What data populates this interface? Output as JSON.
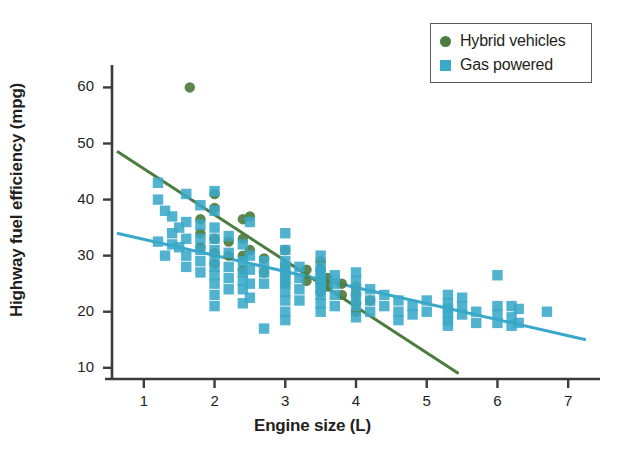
{
  "chart_data": {
    "type": "scatter",
    "title": "",
    "xlabel": "Engine size (L)",
    "ylabel": "Highway fuel efficiency (mpg)",
    "xlim": [
      0.55,
      7.45
    ],
    "ylim": [
      8.0,
      64.0
    ],
    "xticks": [
      1,
      2,
      3,
      4,
      5,
      6,
      7
    ],
    "yticks": [
      10,
      20,
      30,
      40,
      50,
      60
    ],
    "grid": false,
    "legend_position": "top-right",
    "legend": [
      {
        "name": "Hybrid vehicles",
        "marker": "circle",
        "color": "#4d7c3f"
      },
      {
        "name": "Gas powered",
        "marker": "square",
        "color": "#39a8c9"
      }
    ],
    "series": [
      {
        "name": "Hybrid vehicles",
        "marker": "circle",
        "color": "#4d7c3f",
        "points": [
          [
            1.65,
            60.0
          ],
          [
            1.8,
            36.5
          ],
          [
            1.8,
            34.0
          ],
          [
            1.8,
            31.5
          ],
          [
            2.0,
            41.0
          ],
          [
            2.0,
            38.5
          ],
          [
            2.0,
            33.0
          ],
          [
            2.0,
            30.5
          ],
          [
            2.0,
            28.5
          ],
          [
            2.2,
            32.5
          ],
          [
            2.2,
            30.0
          ],
          [
            2.4,
            36.5
          ],
          [
            2.4,
            33.0
          ],
          [
            2.4,
            30.0
          ],
          [
            2.4,
            27.5
          ],
          [
            2.5,
            37.0
          ],
          [
            2.5,
            31.0
          ],
          [
            2.7,
            29.5
          ],
          [
            2.7,
            27.0
          ],
          [
            3.0,
            31.0
          ],
          [
            3.0,
            28.0
          ],
          [
            3.0,
            26.5
          ],
          [
            3.0,
            25.0
          ],
          [
            3.3,
            27.5
          ],
          [
            3.3,
            25.5
          ],
          [
            3.5,
            29.0
          ],
          [
            3.5,
            27.5
          ],
          [
            3.5,
            26.0
          ],
          [
            3.5,
            25.0
          ],
          [
            3.5,
            23.5
          ],
          [
            3.6,
            26.0
          ],
          [
            3.6,
            24.5
          ],
          [
            3.8,
            25.0
          ],
          [
            3.8,
            23.0
          ],
          [
            4.0,
            24.5
          ],
          [
            4.0,
            23.0
          ],
          [
            4.0,
            21.5
          ],
          [
            4.0,
            20.0
          ],
          [
            4.2,
            22.0
          ]
        ]
      },
      {
        "name": "Gas powered",
        "marker": "square",
        "color": "#39a8c9",
        "points": [
          [
            1.2,
            43.0
          ],
          [
            1.2,
            40.0
          ],
          [
            1.2,
            32.5
          ],
          [
            1.3,
            38.0
          ],
          [
            1.3,
            30.0
          ],
          [
            1.4,
            37.0
          ],
          [
            1.4,
            34.0
          ],
          [
            1.4,
            32.0
          ],
          [
            1.5,
            35.0
          ],
          [
            1.5,
            31.5
          ],
          [
            1.6,
            41.0
          ],
          [
            1.6,
            36.0
          ],
          [
            1.6,
            33.0
          ],
          [
            1.6,
            30.0
          ],
          [
            1.6,
            28.0
          ],
          [
            1.8,
            39.0
          ],
          [
            1.8,
            35.5
          ],
          [
            1.8,
            33.0
          ],
          [
            1.8,
            31.0
          ],
          [
            1.8,
            29.0
          ],
          [
            1.8,
            27.0
          ],
          [
            2.0,
            41.5
          ],
          [
            2.0,
            38.0
          ],
          [
            2.0,
            35.0
          ],
          [
            2.0,
            33.0
          ],
          [
            2.0,
            31.0
          ],
          [
            2.0,
            29.5
          ],
          [
            2.0,
            28.0
          ],
          [
            2.0,
            26.5
          ],
          [
            2.0,
            25.0
          ],
          [
            2.0,
            23.0
          ],
          [
            2.0,
            21.0
          ],
          [
            2.2,
            33.5
          ],
          [
            2.2,
            30.5
          ],
          [
            2.2,
            28.0
          ],
          [
            2.2,
            26.0
          ],
          [
            2.2,
            24.0
          ],
          [
            2.4,
            32.0
          ],
          [
            2.4,
            29.0
          ],
          [
            2.4,
            27.0
          ],
          [
            2.4,
            25.5
          ],
          [
            2.4,
            24.0
          ],
          [
            2.4,
            21.5
          ],
          [
            2.5,
            36.0
          ],
          [
            2.5,
            30.0
          ],
          [
            2.5,
            27.5
          ],
          [
            2.5,
            25.0
          ],
          [
            2.5,
            22.5
          ],
          [
            2.7,
            29.0
          ],
          [
            2.7,
            27.0
          ],
          [
            2.7,
            25.0
          ],
          [
            2.7,
            17.0
          ],
          [
            3.0,
            34.0
          ],
          [
            3.0,
            31.0
          ],
          [
            3.0,
            29.0
          ],
          [
            3.0,
            28.0
          ],
          [
            3.0,
            27.0
          ],
          [
            3.0,
            26.0
          ],
          [
            3.0,
            25.0
          ],
          [
            3.0,
            23.5
          ],
          [
            3.0,
            22.0
          ],
          [
            3.0,
            20.0
          ],
          [
            3.0,
            18.5
          ],
          [
            3.2,
            28.0
          ],
          [
            3.2,
            26.0
          ],
          [
            3.2,
            24.0
          ],
          [
            3.2,
            22.0
          ],
          [
            3.5,
            30.0
          ],
          [
            3.5,
            28.0
          ],
          [
            3.5,
            27.0
          ],
          [
            3.5,
            26.0
          ],
          [
            3.5,
            25.0
          ],
          [
            3.5,
            24.0
          ],
          [
            3.5,
            23.0
          ],
          [
            3.5,
            21.5
          ],
          [
            3.5,
            20.0
          ],
          [
            3.7,
            26.5
          ],
          [
            3.7,
            25.0
          ],
          [
            3.7,
            23.0
          ],
          [
            3.7,
            21.0
          ],
          [
            4.0,
            27.0
          ],
          [
            4.0,
            25.5
          ],
          [
            4.0,
            24.0
          ],
          [
            4.0,
            22.5
          ],
          [
            4.0,
            21.0
          ],
          [
            4.0,
            19.0
          ],
          [
            4.2,
            24.0
          ],
          [
            4.2,
            22.0
          ],
          [
            4.2,
            20.0
          ],
          [
            4.4,
            23.0
          ],
          [
            4.4,
            21.0
          ],
          [
            4.6,
            22.0
          ],
          [
            4.6,
            20.0
          ],
          [
            4.6,
            18.5
          ],
          [
            4.8,
            21.0
          ],
          [
            4.8,
            19.5
          ],
          [
            5.0,
            22.0
          ],
          [
            5.0,
            20.0
          ],
          [
            5.3,
            23.0
          ],
          [
            5.3,
            21.5
          ],
          [
            5.3,
            20.5
          ],
          [
            5.3,
            19.5
          ],
          [
            5.3,
            18.5
          ],
          [
            5.3,
            17.5
          ],
          [
            5.5,
            22.5
          ],
          [
            5.5,
            21.0
          ],
          [
            5.5,
            19.5
          ],
          [
            5.7,
            20.0
          ],
          [
            5.7,
            18.0
          ],
          [
            6.0,
            26.5
          ],
          [
            6.0,
            21.0
          ],
          [
            6.0,
            19.5
          ],
          [
            6.0,
            18.0
          ],
          [
            6.2,
            21.0
          ],
          [
            6.2,
            19.0
          ],
          [
            6.2,
            17.5
          ],
          [
            6.3,
            20.5
          ],
          [
            6.3,
            18.0
          ],
          [
            6.7,
            20.0
          ]
        ]
      }
    ],
    "trendlines": [
      {
        "name": "Hybrid vehicles trend",
        "color": "#4d7c3f",
        "x_start": 0.62,
        "y_start": 48.6,
        "x_end": 5.45,
        "y_end": 9.0
      },
      {
        "name": "Gas powered trend",
        "color": "#39a8c9",
        "x_start": 0.62,
        "y_start": 34.0,
        "x_end": 7.25,
        "y_end": 15.0
      }
    ]
  }
}
